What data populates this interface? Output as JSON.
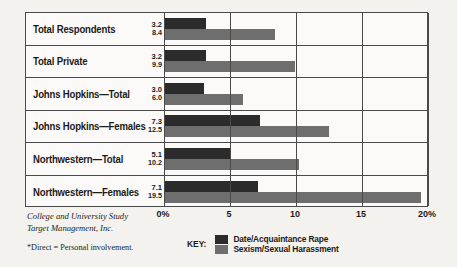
{
  "chart_data": {
    "type": "bar",
    "orientation": "horizontal",
    "title": "",
    "xlabel": "",
    "ylabel": "",
    "xlim": [
      0,
      20
    ],
    "grid": true,
    "legend_position": "bottom",
    "tick_labels": [
      "0%",
      "5",
      "10",
      "15",
      "20%"
    ],
    "tick_values": [
      0,
      5,
      10,
      15,
      20
    ],
    "categories": [
      "Total Respondents",
      "Total Private",
      "Johns Hopkins—Total",
      "Johns Hopkins—Females",
      "Northwestern—Total",
      "Northwestern—Females"
    ],
    "series": [
      {
        "name": "Date/Acquaintance Rape",
        "color": "#2b2b2b",
        "values": [
          3.2,
          3.2,
          3.0,
          7.3,
          5.1,
          7.1
        ]
      },
      {
        "name": "Sexism/Sexual Harassment",
        "color": "#6e6e6e",
        "values": [
          8.4,
          9.9,
          6.0,
          12.5,
          10.2,
          19.5
        ]
      }
    ],
    "value_labels": [
      {
        "top": "3.2",
        "bottom": "8.4"
      },
      {
        "top": "3.2",
        "bottom": "9.9"
      },
      {
        "top": "3.0",
        "bottom": "6.0"
      },
      {
        "top": "7.3",
        "bottom": "12.5"
      },
      {
        "top": "5.1",
        "bottom": "10.2"
      },
      {
        "top": "7.1",
        "bottom": "19.5"
      }
    ]
  },
  "legend": {
    "key_label": "KEY:",
    "items": [
      {
        "label": "Date/Acquaintance Rape",
        "color": "#2b2b2b"
      },
      {
        "label": "Sexism/Sexual Harassment",
        "color": "#6e6e6e"
      }
    ]
  },
  "source": {
    "line1": "College and University Study",
    "line2": "Target Management, Inc."
  },
  "footnote": "*Direct = Personal involvement."
}
